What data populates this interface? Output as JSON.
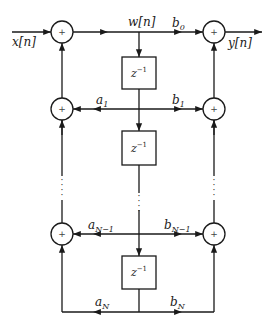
{
  "diagram": {
    "type": "direct-form-II IIR filter block diagram",
    "input_label": "x[n]",
    "output_label": "y[n]",
    "state_label": "w[n]",
    "adder_symbol": "+",
    "delay_label_base": "z",
    "delay_label_exp": "−1",
    "ellipsis": "⋮",
    "feedback_coeffs": [
      {
        "base": "a",
        "sub": "1"
      },
      {
        "base": "a",
        "sub": "N−1"
      },
      {
        "base": "a",
        "sub": "N"
      }
    ],
    "feedforward_coeffs": [
      {
        "base": "b",
        "sub": "0"
      },
      {
        "base": "b",
        "sub": "1"
      },
      {
        "base": "b",
        "sub": "N−1"
      },
      {
        "base": "b",
        "sub": "N"
      }
    ],
    "line_color": "#1a1a1a"
  }
}
